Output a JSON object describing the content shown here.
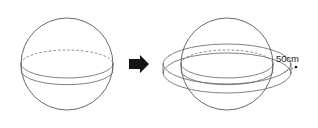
{
  "figure": {
    "title": "Sphere transformed into sphere with equatorial band",
    "background_color": "#ffffff",
    "line_color": "#58585c",
    "label_color": "#1c1c1c",
    "arrow_color": "#141414"
  },
  "left_figure": {
    "name": "plain-sphere",
    "shape": "sphere",
    "center_x": 67,
    "center_y": 64,
    "radius": 46,
    "equator": {
      "rx": 46,
      "ry": 14,
      "hidden_arc_style": "dashed",
      "visible_arc_style": "solid",
      "band_offset": 9
    }
  },
  "transform_arrow": {
    "name": "transform-arrow",
    "glyph": "right-arrow",
    "direction": "right",
    "x": 130,
    "y": 64,
    "color": "#141414"
  },
  "right_figure": {
    "name": "sphere-with-band",
    "shape": "sphere-with-equatorial-ring",
    "center_x": 227,
    "center_y": 64,
    "radius": 46,
    "equator": {
      "rx": 46,
      "ry": 14,
      "hidden_arc_style": "dashed",
      "visible_arc_style": "solid",
      "band_offset": 9
    },
    "ring": {
      "rx": 64,
      "ry": 20,
      "band_offset": 9,
      "style": "solid"
    }
  },
  "dimension": {
    "name": "band-width-dimension",
    "label": "50cm",
    "value": 50,
    "unit": "cm",
    "label_x": 289,
    "label_y": 62,
    "leader_from_x": 296,
    "leader_from_y": 66,
    "leader_to_x": 283,
    "leader_to_y": 72
  }
}
